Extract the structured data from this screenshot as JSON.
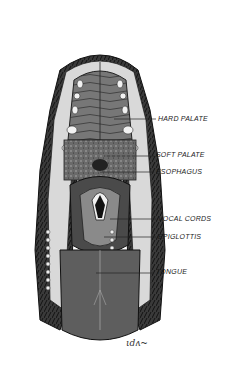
{
  "figure": {
    "colors": {
      "background": "#ffffff",
      "fur": "#2a2a2a",
      "skin_light": "#d9d9d9",
      "palate": "#6e6e6e",
      "tongue": "#5e5e5e",
      "teeth": "#f2f2f2",
      "ink": "#1a1a1a"
    }
  },
  "labels": [
    {
      "id": "hard-palate",
      "text": "HARD PALATE",
      "x": 158,
      "y": 115,
      "line_from_x": 114,
      "line_y": 119
    },
    {
      "id": "soft-palate",
      "text": "SOFT PALATE",
      "x": 156,
      "y": 151,
      "line_from_x": 104,
      "line_y": 156
    },
    {
      "id": "esophagus",
      "text": "ESOPHAGUS",
      "x": 156,
      "y": 168,
      "line_from_x": 100,
      "line_y": 172
    },
    {
      "id": "vocal-cords",
      "text": "VOCAL CORDS",
      "x": 158,
      "y": 215,
      "line_from_x": 110,
      "line_y": 219
    },
    {
      "id": "epiglottis",
      "text": "EPIGLOTTIS",
      "x": 158,
      "y": 233,
      "line_from_x": 104,
      "line_y": 237
    },
    {
      "id": "tongue",
      "text": "TONGUE",
      "x": 156,
      "y": 268,
      "line_from_x": 96,
      "line_y": 273
    }
  ],
  "signature": {
    "text": "ιdʌ~",
    "x": 126,
    "y": 342
  }
}
